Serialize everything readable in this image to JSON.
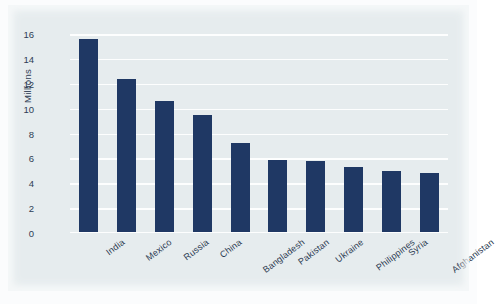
{
  "chart_data": {
    "type": "bar",
    "title": "",
    "xlabel": "",
    "ylabel": "Millions",
    "categories": [
      "India",
      "Mexico",
      "Russia",
      "China",
      "Bangladesh",
      "Pakistan",
      "Ukraine",
      "Philippines",
      "Syria",
      "Afghanistan"
    ],
    "values": [
      15.6,
      12.4,
      10.6,
      9.5,
      7.2,
      5.9,
      5.8,
      5.3,
      5.0,
      4.8
    ],
    "ylim": [
      0,
      16
    ],
    "yticks": [
      0,
      2,
      4,
      6,
      8,
      10,
      12,
      14,
      16
    ],
    "ytick_labels": [
      "0",
      "2",
      "4",
      "6",
      "8",
      "10",
      "12",
      "14",
      "16"
    ],
    "grid": true,
    "legend": false,
    "bar_color": "#1f3864",
    "plot_background": "#e6ecee",
    "gridline_color": "#fdfefe"
  }
}
